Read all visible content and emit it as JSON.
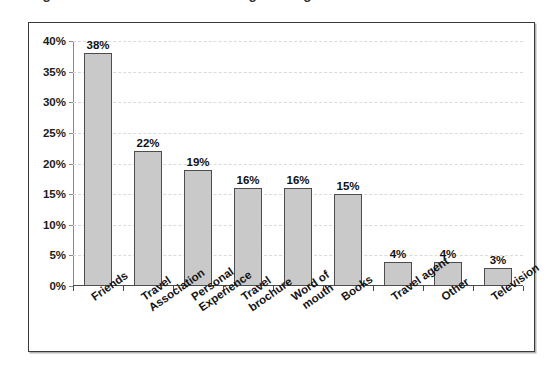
{
  "chart_title_visible_fragment": "Figure: Sources consulted when gathering information",
  "chart_data": {
    "type": "bar",
    "title": "",
    "xlabel": "",
    "ylabel": "",
    "ylim": [
      0,
      40
    ],
    "ytick_step": 5,
    "grid": true,
    "legend": "none",
    "orientation": "vertical",
    "value_label_suffix": "%",
    "categories": [
      "Friends",
      "Travel Association",
      "Personal Experience",
      "Travel brochure",
      "Word of mouth",
      "Books",
      "Travel agent",
      "Other",
      "Television"
    ],
    "category_label_lines": [
      [
        "Friends"
      ],
      [
        "Travel",
        "Association"
      ],
      [
        "Personal",
        "Experience"
      ],
      [
        "Travel",
        "brochure"
      ],
      [
        "Word of",
        "mouth"
      ],
      [
        "Books"
      ],
      [
        "Travel agent"
      ],
      [
        "Other"
      ],
      [
        "Television"
      ]
    ],
    "values": [
      38,
      22,
      19,
      16,
      16,
      15,
      4,
      4,
      3
    ],
    "value_labels": [
      "38%",
      "22%",
      "19%",
      "16%",
      "16%",
      "15%",
      "4%",
      "4%",
      "3%"
    ],
    "ytick_labels": [
      "0%",
      "5%",
      "10%",
      "15%",
      "20%",
      "25%",
      "30%",
      "35%",
      "40%"
    ],
    "ytick_values": [
      0,
      5,
      10,
      15,
      20,
      25,
      30,
      35,
      40
    ],
    "colors": {
      "bar_fill": "#c9c9c9",
      "bar_border": "#4d4d4d",
      "gridline": "#dadada",
      "axis": "#4a4a4a",
      "text": "#111111",
      "frame_border": "#3a3a3a",
      "background": "#ffffff"
    }
  }
}
